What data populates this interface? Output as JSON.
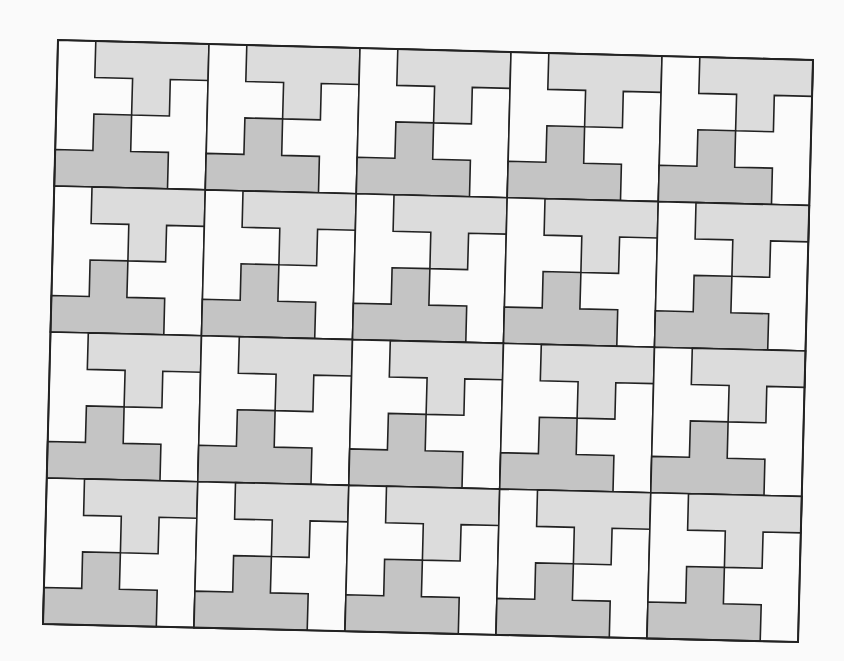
{
  "figure": {
    "rows": 4,
    "cols": 5,
    "corners": {
      "top_left": [
        58,
        40
      ],
      "top_right": [
        813,
        60
      ],
      "bottom_left": [
        43,
        624
      ],
      "bottom_right": [
        798,
        642
      ]
    },
    "colors": {
      "background": "#fafafa",
      "cell_fill": "#fbfbfb",
      "light_tile": "#dcdcdc",
      "dark_tile": "#c4c4c4",
      "stroke": "#222222"
    },
    "stroke_width": 1.6,
    "tile_shapes": {
      "light_t": [
        [
          0.25,
          0
        ],
        [
          1,
          0
        ],
        [
          1,
          0.25
        ],
        [
          0.75,
          0.25
        ],
        [
          0.75,
          0.5
        ],
        [
          0.5,
          0.5
        ],
        [
          0.5,
          0.25
        ],
        [
          0.25,
          0.25
        ]
      ],
      "dark_t": [
        [
          0,
          0.75
        ],
        [
          0.25,
          0.75
        ],
        [
          0.25,
          0.5
        ],
        [
          0.5,
          0.5
        ],
        [
          0.5,
          0.75
        ],
        [
          0.75,
          0.75
        ],
        [
          0.75,
          1
        ],
        [
          0,
          1
        ]
      ]
    }
  }
}
